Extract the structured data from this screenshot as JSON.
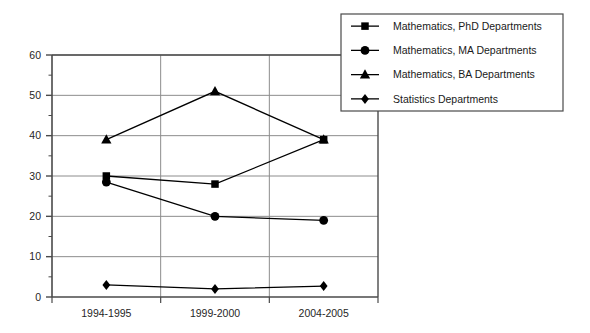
{
  "chart_data": {
    "type": "line",
    "title": "",
    "subtitle": "",
    "xlabel": "",
    "ylabel": "",
    "categories": [
      "1994-1995",
      "1999-2000",
      "2004-2005"
    ],
    "ylim": [
      0,
      60
    ],
    "yticks": [
      0,
      10,
      20,
      30,
      40,
      50,
      60
    ],
    "ytick_labels": [
      "0",
      "10",
      "20",
      "30",
      "40",
      "50",
      "60"
    ],
    "minor_tick_step": 5,
    "grid": "horizontal-and-vertical",
    "legend_position": "top-right",
    "series": [
      {
        "name": "Mathematics, PhD Departments",
        "marker": "square",
        "color": "#000000",
        "values": [
          30,
          28,
          39
        ]
      },
      {
        "name": "Mathematics, MA Departments",
        "marker": "circle",
        "color": "#000000",
        "values": [
          28.5,
          20,
          19
        ]
      },
      {
        "name": "Mathematics, BA Departments",
        "marker": "triangle",
        "color": "#000000",
        "values": [
          39,
          51,
          39
        ]
      },
      {
        "name": "Statistics Departments",
        "marker": "diamond",
        "color": "#000000",
        "values": [
          3,
          2,
          2.7
        ]
      }
    ]
  },
  "axis": {
    "y_labels": [
      "60",
      "50",
      "40",
      "30",
      "20",
      "10",
      "0"
    ],
    "x_labels": [
      "1994-1995",
      "1999-2000",
      "2004-2005"
    ]
  },
  "legend": {
    "items": [
      {
        "label": "Mathematics, PhD Departments",
        "marker": "square"
      },
      {
        "label": "Mathematics, MA Departments",
        "marker": "circle"
      },
      {
        "label": "Mathematics, BA Departments",
        "marker": "triangle"
      },
      {
        "label": "Statistics Departments",
        "marker": "diamond"
      }
    ]
  },
  "colors": {
    "ink": "#000000",
    "axis": "#4a4a4a",
    "grid": "#8c8c8c",
    "background": "#ffffff"
  }
}
